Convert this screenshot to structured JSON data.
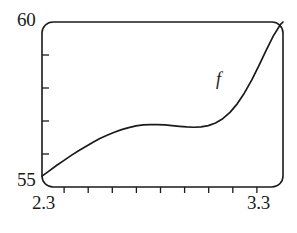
{
  "figure": {
    "background_color": "#ffffff",
    "ink_color": "#1a1a1a"
  },
  "axes": {
    "y_max_label": "60",
    "y_min_label": "55",
    "x_min_label": "2.3",
    "x_max_label": "3.3"
  },
  "curve": {
    "label": "f",
    "color": "#1a1a1a"
  },
  "chart_data": {
    "type": "line",
    "title": "",
    "xlabel": "",
    "ylabel": "",
    "xlim": [
      2.3,
      3.3
    ],
    "ylim": [
      55,
      60
    ],
    "grid": false,
    "legend": "none",
    "frame": "rounded-rectangle-box",
    "x_ticks": [
      2.3,
      2.4,
      2.5,
      2.6,
      2.7,
      2.8,
      2.9,
      3.0,
      3.1,
      3.2,
      3.3
    ],
    "x_tick_labels": [
      "2.3",
      "",
      "",
      "",
      "",
      "",
      "",
      "",
      "",
      "",
      "3.3"
    ],
    "x_tick_direction": "outward",
    "y_ticks": [
      55,
      56,
      57,
      58,
      59,
      60
    ],
    "y_tick_labels": [
      "55",
      "",
      "",
      "",
      "",
      "60"
    ],
    "y_tick_direction": "inward",
    "series": [
      {
        "name": "f",
        "annotation": "f",
        "annotation_x": 3.02,
        "annotation_y": 58.05,
        "x": [
          2.3,
          2.33,
          2.36,
          2.39,
          2.42,
          2.45,
          2.48,
          2.51,
          2.54,
          2.57,
          2.6,
          2.63,
          2.66,
          2.69,
          2.72,
          2.75,
          2.78,
          2.81,
          2.84,
          2.87,
          2.9,
          2.93,
          2.96,
          2.99,
          3.02,
          3.05,
          3.08,
          3.11,
          3.14,
          3.17,
          3.2,
          3.23,
          3.26,
          3.29,
          3.3
        ],
        "y": [
          55.33,
          55.49,
          55.65,
          55.8,
          55.95,
          56.09,
          56.22,
          56.35,
          56.47,
          56.57,
          56.66,
          56.74,
          56.8,
          56.85,
          56.88,
          56.89,
          56.89,
          56.88,
          56.86,
          56.84,
          56.82,
          56.81,
          56.82,
          56.86,
          56.94,
          57.07,
          57.26,
          57.52,
          57.85,
          58.24,
          58.68,
          59.14,
          59.58,
          59.93,
          60.0
        ]
      }
    ]
  }
}
